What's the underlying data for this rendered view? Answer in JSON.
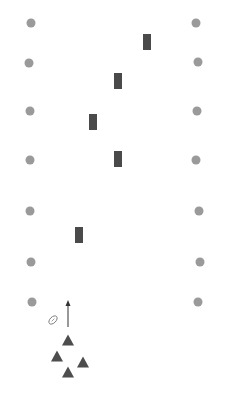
{
  "diagram": {
    "type": "football-drill",
    "colors": {
      "cone": "#9a9a9a",
      "dummy": "#4a4a4a",
      "player": "#4d4d4d",
      "arrow": "#333333",
      "ball": "#666666",
      "background": "#ffffff"
    },
    "cones_left": [
      {
        "x": 31,
        "y": 23
      },
      {
        "x": 29,
        "y": 63
      },
      {
        "x": 30,
        "y": 111
      },
      {
        "x": 30,
        "y": 160
      },
      {
        "x": 30,
        "y": 211
      },
      {
        "x": 31,
        "y": 262
      },
      {
        "x": 32,
        "y": 302
      }
    ],
    "cones_right": [
      {
        "x": 196,
        "y": 23
      },
      {
        "x": 198,
        "y": 62
      },
      {
        "x": 197,
        "y": 111
      },
      {
        "x": 196,
        "y": 160
      },
      {
        "x": 199,
        "y": 211
      },
      {
        "x": 200,
        "y": 262
      },
      {
        "x": 198,
        "y": 302
      }
    ],
    "dummies": [
      {
        "x": 147,
        "y": 42
      },
      {
        "x": 118,
        "y": 81
      },
      {
        "x": 93,
        "y": 122
      },
      {
        "x": 118,
        "y": 159
      },
      {
        "x": 79,
        "y": 235
      }
    ],
    "players": [
      {
        "x": 68,
        "y": 340
      },
      {
        "x": 57,
        "y": 356
      },
      {
        "x": 83,
        "y": 362
      },
      {
        "x": 68,
        "y": 372
      }
    ],
    "arrow": {
      "x1": 68,
      "y1": 327,
      "x2": 68,
      "y2": 300
    },
    "ball": {
      "x": 53,
      "y": 320,
      "icon": "football-icon"
    }
  }
}
